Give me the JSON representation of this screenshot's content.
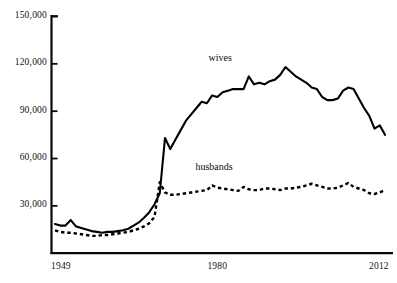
{
  "chart_data": {
    "type": "line",
    "title": "",
    "subtitle": "",
    "xlabel": "",
    "ylabel": "",
    "xlim": [
      1949,
      2012
    ],
    "ylim": [
      0,
      150000
    ],
    "grid": false,
    "legend_position": "inline-annotation",
    "y_ticks": [
      {
        "value": 150000,
        "label": "150,000"
      },
      {
        "value": 120000,
        "label": "120,000"
      },
      {
        "value": 90000,
        "label": "90,000"
      },
      {
        "value": 60000,
        "label": "60,000"
      },
      {
        "value": 30000,
        "label": "30,000"
      }
    ],
    "x_ticks": [
      {
        "value": 1949,
        "label": "1949"
      },
      {
        "value": 1980,
        "label": "1980"
      },
      {
        "value": 2012,
        "label": "2012"
      }
    ],
    "annotations": [
      {
        "text": "wives",
        "x": 1981,
        "y": 123000
      },
      {
        "text": "husbands",
        "x": 1980,
        "y": 54000
      }
    ],
    "series": [
      {
        "name": "wives",
        "style": "solid",
        "color": "#000000",
        "x": [
          1949,
          1950,
          1951,
          1952,
          1953,
          1954,
          1955,
          1956,
          1957,
          1958,
          1959,
          1960,
          1961,
          1962,
          1963,
          1964,
          1965,
          1966,
          1967,
          1968,
          1969,
          1970,
          1971,
          1972,
          1973,
          1974,
          1975,
          1976,
          1977,
          1978,
          1979,
          1980,
          1981,
          1982,
          1983,
          1984,
          1985,
          1986,
          1987,
          1988,
          1989,
          1990,
          1991,
          1992,
          1993,
          1994,
          1995,
          1996,
          1997,
          1998,
          1999,
          2000,
          2001,
          2002,
          2003,
          2004,
          2005,
          2006,
          2007,
          2008,
          2009,
          2010,
          2011,
          2012
        ],
        "values": [
          18500,
          17500,
          17500,
          21000,
          17000,
          16000,
          15000,
          14000,
          13500,
          13000,
          13500,
          13500,
          14000,
          14500,
          15500,
          17500,
          19500,
          22500,
          26000,
          31000,
          38000,
          73000,
          66000,
          72000,
          78000,
          84000,
          88000,
          92000,
          96000,
          95000,
          100000,
          99000,
          102000,
          103000,
          104000,
          104000,
          104000,
          112000,
          107000,
          108000,
          107000,
          109000,
          110000,
          113000,
          118000,
          115000,
          112000,
          110000,
          108000,
          105000,
          104000,
          99000,
          97000,
          97000,
          98000,
          103000,
          105000,
          104000,
          98000,
          92000,
          87000,
          79000,
          81000,
          75000
        ]
      },
      {
        "name": "husbands",
        "style": "dashed",
        "color": "#000000",
        "x": [
          1949,
          1950,
          1951,
          1952,
          1953,
          1954,
          1955,
          1956,
          1957,
          1958,
          1959,
          1960,
          1961,
          1962,
          1963,
          1964,
          1965,
          1966,
          1967,
          1968,
          1969,
          1970,
          1971,
          1972,
          1973,
          1974,
          1975,
          1976,
          1977,
          1978,
          1979,
          1980,
          1981,
          1982,
          1983,
          1984,
          1985,
          1986,
          1987,
          1988,
          1989,
          1990,
          1991,
          1992,
          1993,
          1994,
          1995,
          1996,
          1997,
          1998,
          1999,
          2000,
          2001,
          2002,
          2003,
          2004,
          2005,
          2006,
          2007,
          2008,
          2009,
          2010,
          2011,
          2012
        ],
        "values": [
          14500,
          13500,
          13000,
          13000,
          12500,
          12000,
          11500,
          11000,
          11000,
          11500,
          11500,
          12000,
          12500,
          13000,
          13500,
          14500,
          15500,
          17000,
          19000,
          23000,
          45000,
          38500,
          37000,
          37000,
          37500,
          38000,
          38500,
          39000,
          39500,
          40000,
          43000,
          41500,
          41000,
          40500,
          40000,
          39500,
          42000,
          40500,
          40000,
          40000,
          41000,
          41000,
          40500,
          40000,
          41000,
          41000,
          41500,
          42000,
          43000,
          44000,
          43000,
          42000,
          41000,
          41000,
          41500,
          43000,
          44500,
          42000,
          41000,
          40000,
          38000,
          37500,
          38500,
          40000
        ]
      }
    ]
  }
}
